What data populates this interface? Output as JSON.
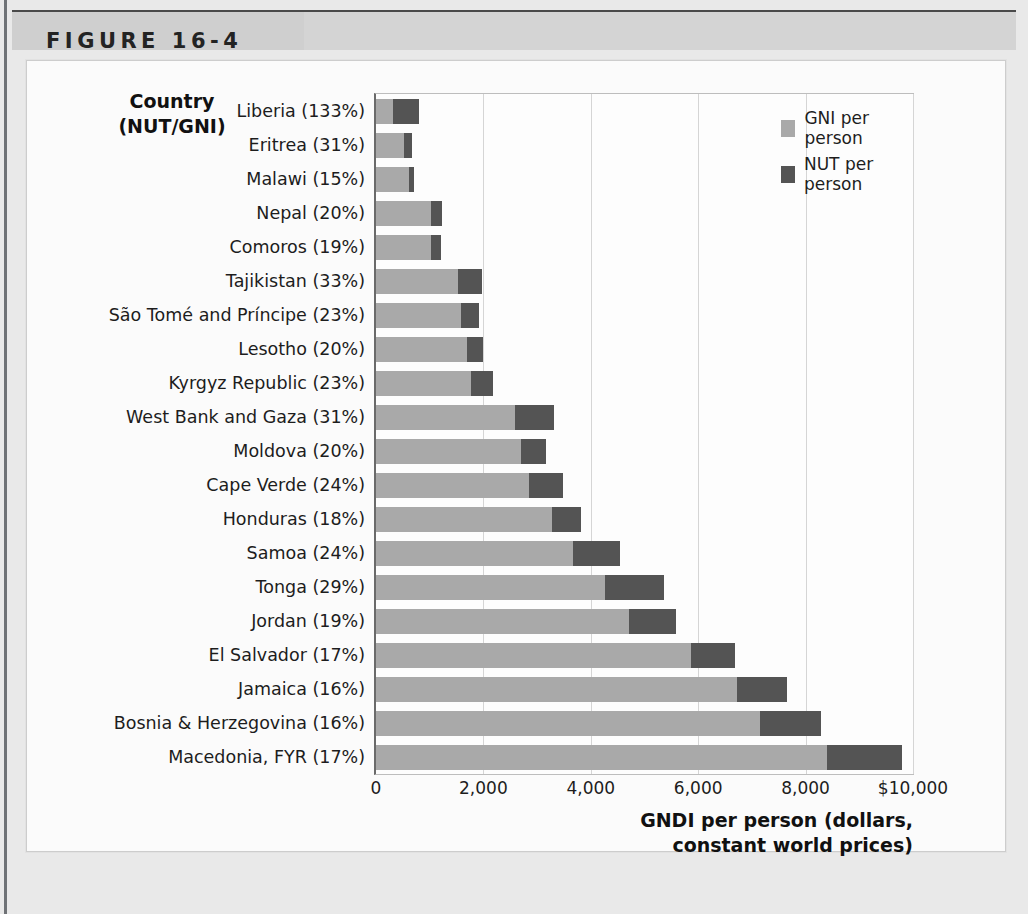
{
  "figure": {
    "label": "FIGURE 16-4"
  },
  "axes_labels": {
    "corner_line1": "Country",
    "corner_line2": "(NUT/GNI)",
    "xaxis_line1": "GNDI per person (dollars,",
    "xaxis_line2": "constant world prices)"
  },
  "legend": {
    "gni_label": "GNI per person",
    "nut_label": "NUT per person",
    "gni_color": "#a9a9a9",
    "nut_color": "#545454"
  },
  "chart_data": {
    "type": "bar",
    "orientation": "horizontal",
    "stacked": true,
    "title": "FIGURE 16-4",
    "xlabel": "GNDI per person (dollars, constant world prices)",
    "ylabel": "Country (NUT/GNI)",
    "xlim": [
      0,
      10000
    ],
    "xticks": [
      0,
      2000,
      4000,
      6000,
      8000,
      10000
    ],
    "xtick_labels": [
      "0",
      "2,000",
      "4,000",
      "6,000",
      "8,000",
      "$10,000"
    ],
    "grid": true,
    "legend_position": "top-right",
    "categories": [
      "Liberia (133%)",
      "Eritrea (31%)",
      "Malawi (15%)",
      "Nepal (20%)",
      "Comoros (19%)",
      "Tajikistan (33%)",
      "São Tomé and Príncipe (23%)",
      "Lesotho (20%)",
      "Kyrgyz Republic (23%)",
      "West Bank and Gaza (31%)",
      "Moldova (20%)",
      "Cape Verde (24%)",
      "Honduras (18%)",
      "Samoa (24%)",
      "Tonga (29%)",
      "Jordan (19%)",
      "El Salvador (17%)",
      "Jamaica (16%)",
      "Bosnia & Herzegovina (16%)",
      "Macedonia, FYR (17%)"
    ],
    "series": [
      {
        "name": "GNI per person",
        "color": "#a9a9a9",
        "values": [
          310,
          520,
          610,
          1020,
          1030,
          1530,
          1580,
          1690,
          1760,
          2590,
          2700,
          2840,
          3280,
          3660,
          4260,
          4720,
          5870,
          6720,
          7160,
          8400
        ]
      },
      {
        "name": "NUT per person",
        "color": "#545454",
        "values": [
          490,
          150,
          90,
          210,
          190,
          450,
          330,
          300,
          420,
          720,
          470,
          640,
          530,
          890,
          1100,
          870,
          820,
          940,
          1120,
          1400
        ]
      }
    ],
    "totals": [
      800,
      670,
      700,
      1230,
      1220,
      1980,
      1910,
      1990,
      2180,
      3310,
      3170,
      3480,
      3810,
      4550,
      5360,
      5590,
      6690,
      7660,
      8280,
      9800
    ]
  }
}
